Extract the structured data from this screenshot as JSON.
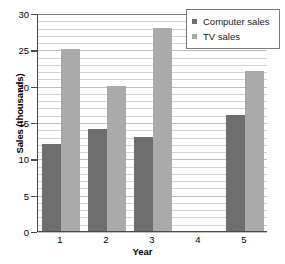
{
  "chart_data": {
    "type": "bar",
    "title": "",
    "subtitle": "",
    "xlabel": "Year",
    "ylabel": "Sales (thousands)",
    "categories": [
      "1",
      "2",
      "3",
      "4",
      "5"
    ],
    "series": [
      {
        "name": "Computer sales",
        "color": "#6e6e6e",
        "values": [
          12,
          14,
          13,
          0,
          16
        ]
      },
      {
        "name": "TV sales",
        "color": "#aaaaaa",
        "values": [
          25,
          20,
          28,
          0,
          22
        ]
      }
    ],
    "ylim": [
      0,
      30
    ],
    "yticks": [
      0,
      5,
      10,
      15,
      20,
      25,
      30
    ],
    "ytick_labels": [
      "0",
      "5",
      "10",
      "15",
      "20",
      "25",
      "30"
    ],
    "grid": true,
    "grid_minor_step": 1,
    "legend_position": "top-right",
    "annotations": "Year 4 has no bars for either series"
  },
  "legend": {
    "items": [
      {
        "label": "Computer sales",
        "swatch": "#6e6e6e"
      },
      {
        "label": "TV sales",
        "swatch": "#aaaaaa"
      }
    ]
  },
  "colors": {
    "computer_sales": "#6e6e6e",
    "tv_sales": "#aaaaaa",
    "axis": "#4a4a4a",
    "gridline": "#d2d2d2",
    "background": "#ffffff"
  }
}
